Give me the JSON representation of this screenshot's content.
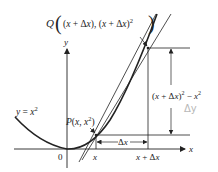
{
  "diagram": {
    "type": "derivative-secant-illustration",
    "colors": {
      "ink": "#222222",
      "handwriting": "#b8b8b8",
      "background": "#ffffff"
    },
    "axes": {
      "x_label": "x",
      "y_label": "y",
      "origin_label": "0"
    },
    "curve": {
      "label": "y = x²"
    },
    "points": {
      "P": {
        "label": "P(x, x²)"
      },
      "Q": {
        "label": "Q((x + Δx), (x + Δx)²)"
      }
    },
    "ticks": {
      "x": "x",
      "x_plus_dx": "x + Δx"
    },
    "dimensions": {
      "horizontal": "Δx",
      "vertical": "(x + Δx)² − x²",
      "vertical_annotation": "Δy"
    }
  }
}
